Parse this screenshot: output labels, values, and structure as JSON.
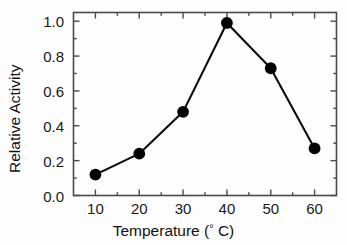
{
  "chart_data": {
    "type": "line",
    "title": "",
    "xlabel": "Temperature (° C)",
    "ylabel": "Relative Activity",
    "x": [
      10,
      20,
      30,
      40,
      50,
      60
    ],
    "values": [
      0.12,
      0.24,
      0.48,
      0.99,
      0.73,
      0.27
    ],
    "series": [
      {
        "name": "Relative Activity",
        "values": [
          0.12,
          0.24,
          0.48,
          0.99,
          0.73,
          0.27
        ]
      }
    ],
    "xlim": [
      5,
      65
    ],
    "ylim": [
      0.0,
      1.05
    ],
    "xticks": [
      10,
      20,
      30,
      40,
      50,
      60
    ],
    "xtick_labels": [
      "10",
      "20",
      "30",
      "40",
      "50",
      "60"
    ],
    "yticks": [
      0.0,
      0.2,
      0.4,
      0.6,
      0.8,
      1.0
    ],
    "ytick_labels": [
      "0.0",
      "0.2",
      "0.4",
      "0.6",
      "0.8",
      "1.0"
    ],
    "x_minor_ticks": [
      15,
      25,
      35,
      45,
      55
    ],
    "y_minor_ticks": [
      0.1,
      0.3,
      0.5,
      0.7,
      0.9
    ],
    "grid": false,
    "legend": false,
    "legend_position": "none",
    "marker": "filled-circle",
    "marker_color": "#000000",
    "line_color": "#000000",
    "frame_color": "#4a4a4a",
    "background_color": "#fdfdfd",
    "annotations": []
  },
  "axis": {
    "xlabel_text": "Temperature (",
    "xlabel_degree": "°",
    "xlabel_tail": " C)",
    "ylabel_text": "Relative Activity"
  }
}
